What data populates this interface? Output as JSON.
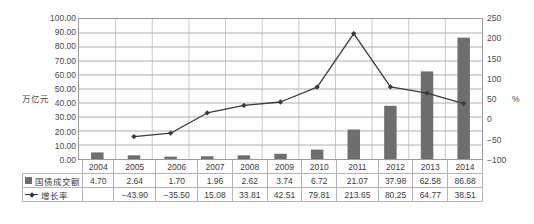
{
  "chart_data": {
    "type": "bar",
    "title": "",
    "categories": [
      "2004",
      "2005",
      "2006",
      "2007",
      "2008",
      "2009",
      "2010",
      "2011",
      "2012",
      "2013",
      "2014"
    ],
    "series": [
      {
        "name": "国债成交额",
        "type": "bar",
        "axis": "left",
        "values": [
          4.7,
          2.64,
          1.7,
          1.96,
          2.62,
          3.74,
          6.72,
          21.07,
          37.98,
          62.58,
          86.68
        ],
        "color": "#6e6e6e"
      },
      {
        "name": "增长率",
        "type": "line",
        "axis": "right",
        "values": [
          null,
          -43.9,
          -35.5,
          15.08,
          33.81,
          42.51,
          79.81,
          213.65,
          80.25,
          64.77,
          38.51
        ],
        "color": "#3a3a3a"
      }
    ],
    "xlabel": "",
    "ylabel": "万亿元",
    "y2label": "%",
    "ylim": [
      0,
      100
    ],
    "y2lim": [
      -100,
      250
    ],
    "yticks": [
      "0.00",
      "10.00",
      "20.00",
      "30.00",
      "40.00",
      "50.00",
      "60.00",
      "70.00",
      "80.00",
      "90.00",
      "100.00"
    ],
    "y2ticks": [
      "-100",
      "-50",
      "0",
      "50",
      "100",
      "150",
      "200",
      "250"
    ],
    "grid": true,
    "legend_position": "table-below"
  },
  "table": {
    "row_labels": [
      "国债成交额",
      "增长率"
    ],
    "years": [
      "2004",
      "2005",
      "2006",
      "2007",
      "2008",
      "2009",
      "2010",
      "2011",
      "2012",
      "2013",
      "2014"
    ],
    "bar_row": [
      "4.70",
      "2.64",
      "1.70",
      "1.96",
      "2.62",
      "3.74",
      "6.72",
      "21.07",
      "37.98",
      "62.58",
      "86.68"
    ],
    "line_row": [
      "",
      "−43.90",
      "−35.50",
      "15.08",
      "33.81",
      "42.51",
      "79.81",
      "213.65",
      "80.25",
      "64.77",
      "38.51"
    ]
  },
  "axes": {
    "left_title": "万亿元",
    "right_title": "%"
  }
}
